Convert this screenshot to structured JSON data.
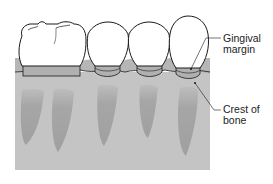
{
  "diagram": {
    "colors": {
      "background": "#ffffff",
      "bone": "#c4c4c4",
      "gum": "#b6b6b6",
      "root": "#a3a3a3",
      "tooth": "#ffffff",
      "outline": "#1a1a1a"
    },
    "labels": [
      {
        "id": "gingival-margin",
        "lines": [
          "Gingival",
          "margin"
        ]
      },
      {
        "id": "crest-of-bone",
        "lines": [
          "Crest of",
          "bone"
        ]
      }
    ],
    "teeth_count": 4
  }
}
